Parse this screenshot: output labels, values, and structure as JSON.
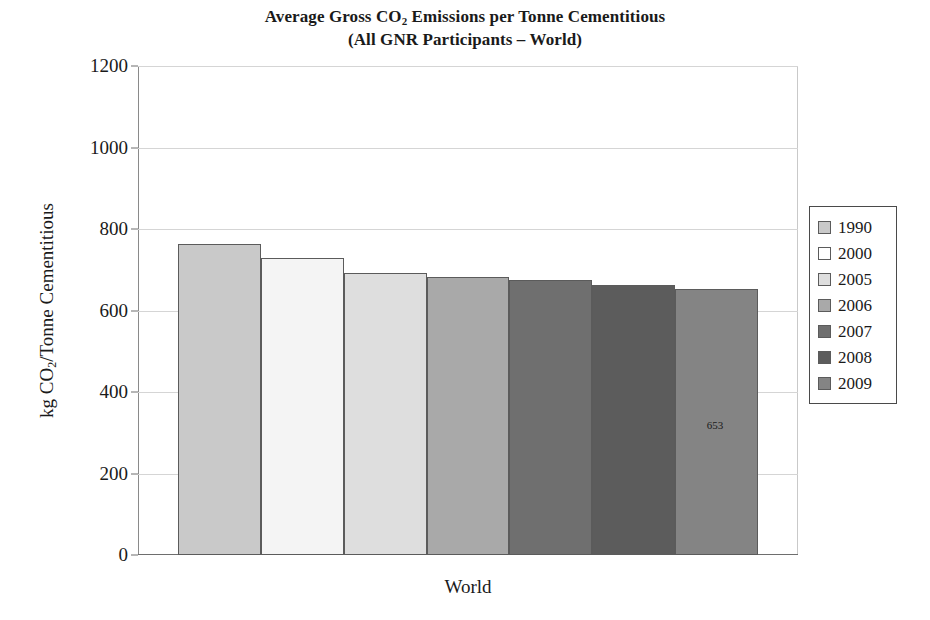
{
  "chart_data": {
    "type": "bar",
    "title": "Average Gross CO2 Emissions per Tonne Cementitious",
    "subtitle": "(All GNR Participants – World)",
    "title_parts": {
      "line1_before_sub": "Average Gross CO",
      "line1_sub": "2",
      "line1_after_sub": " Emissions per Tonne Cementitious",
      "line2": "(All GNR Participants – World)"
    },
    "xlabel": "World",
    "ylabel": "kg CO2/Tonne Cementitious",
    "ylabel_parts": {
      "before_sub": "kg CO",
      "sub": "2",
      "after_sub": "/Tonne Cementitious"
    },
    "categories": [
      "1990",
      "2000",
      "2005",
      "2006",
      "2007",
      "2008",
      "2009"
    ],
    "values": [
      763,
      728,
      692,
      682,
      676,
      663,
      653
    ],
    "bar_colors": [
      "#c9c9c9",
      "#f4f4f4",
      "#dedede",
      "#a9a9a9",
      "#6f6f6f",
      "#5c5c5c",
      "#848484"
    ],
    "bar_border_color": "#5b5b5b",
    "ylim": [
      0,
      1200
    ],
    "ytick_values": [
      0,
      200,
      400,
      600,
      800,
      1000,
      1200
    ],
    "ytick_labels": [
      "0",
      "200",
      "400",
      "600",
      "800",
      "1000",
      "1200"
    ],
    "grid": true,
    "grid_color": "#d5d5d5",
    "legend_position": "right",
    "legend_entries": [
      {
        "label": "1990",
        "color": "#c9c9c9"
      },
      {
        "label": "2000",
        "color": "#ffffff"
      },
      {
        "label": "2005",
        "color": "#dedede"
      },
      {
        "label": "2006",
        "color": "#a9a9a9"
      },
      {
        "label": "2007",
        "color": "#6f6f6f"
      },
      {
        "label": "2008",
        "color": "#5c5c5c"
      },
      {
        "label": "2009",
        "color": "#848484"
      }
    ],
    "data_labels": [
      {
        "series": "2009",
        "value": "653",
        "value_num": 653,
        "inside_bar": true
      }
    ]
  }
}
